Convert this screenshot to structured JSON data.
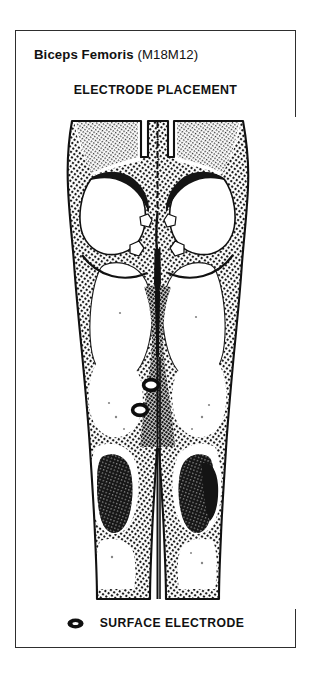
{
  "card": {
    "title_muscle": "Biceps Femoris",
    "title_code": "(M18M12)",
    "subtitle": "ELECTRODE PLACEMENT"
  },
  "figure": {
    "view": "posterior",
    "body_region": "gluteal-region-and-both-lower-limbs",
    "electrodes": [
      {
        "id": "electrode-proximal",
        "side": "left-limb",
        "cx": 135,
        "cy": 268,
        "rx": 7.2,
        "ry": 5.2
      },
      {
        "id": "electrode-distal",
        "side": "left-limb",
        "cx": 124,
        "cy": 293,
        "rx": 7.2,
        "ry": 5.2
      }
    ]
  },
  "legend": {
    "marker_icon": "surface-electrode-icon",
    "label": "SURFACE ELECTRODE"
  },
  "colors": {
    "ink": "#111111",
    "frame": "#2e2e2e",
    "paper": "#ffffff",
    "stipple": "#1a1a1a"
  }
}
